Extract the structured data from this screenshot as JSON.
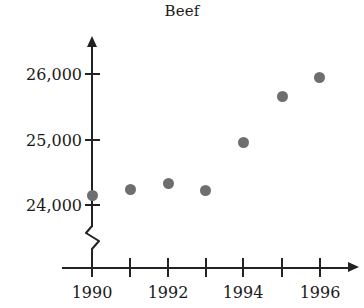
{
  "chart_data": {
    "type": "scatter",
    "title": "Beef",
    "xlabel": "",
    "ylabel": "",
    "x": [
      1990,
      1991,
      1992,
      1993,
      1994,
      1995,
      1996
    ],
    "values": [
      24150,
      24250,
      24340,
      24230,
      24960,
      25670,
      25950
    ],
    "series": [
      {
        "name": "Beef",
        "values": [
          24150,
          24250,
          24340,
          24230,
          24960,
          25670,
          25950
        ]
      }
    ],
    "xlim": [
      1989.5,
      1996.8
    ],
    "ylim": [
      24000,
      26200
    ],
    "y_ticks": [
      24000,
      25000,
      26000
    ],
    "y_tick_labels": [
      "24,000",
      "25,000",
      "26,000"
    ],
    "x_ticks": [
      1990,
      1991,
      1992,
      1993,
      1994,
      1995,
      1996
    ],
    "x_tick_labels": [
      "1990",
      "",
      "1992",
      "",
      "1994",
      "",
      "1996"
    ],
    "grid": false,
    "legend": "none",
    "axis_break": true,
    "marker_color": "#6e6e6e",
    "axis_color": "#222222",
    "text_color": "#1a1a1a",
    "background": "#ffffff"
  },
  "axis": {
    "y_labels": [
      {
        "text": "26,000",
        "top": 65
      },
      {
        "text": "25,000",
        "top": 131
      },
      {
        "text": "24,000",
        "top": 196
      }
    ],
    "y_tick_tops": [
      73,
      139,
      204
    ],
    "x_labels": [
      {
        "text": "1990",
        "left": 62
      },
      {
        "text": "1992",
        "left": 138
      },
      {
        "text": "1994",
        "left": 213
      },
      {
        "text": "1996",
        "left": 290
      }
    ],
    "x_tick_lefts": [
      91,
      129,
      167,
      205,
      242,
      281,
      319
    ]
  },
  "points": [
    {
      "name": "point-1990",
      "left": 87,
      "top": 190,
      "year": "1990",
      "value": "24,150"
    },
    {
      "name": "point-1991",
      "left": 125,
      "top": 184,
      "year": "1991",
      "value": "24,250"
    },
    {
      "name": "point-1992",
      "left": 163,
      "top": 178,
      "year": "1992",
      "value": "24,340"
    },
    {
      "name": "point-1993",
      "left": 200,
      "top": 185,
      "year": "1993",
      "value": "24,230"
    },
    {
      "name": "point-1994",
      "left": 238,
      "top": 137,
      "year": "1994",
      "value": "24,960"
    },
    {
      "name": "point-1995",
      "left": 277,
      "top": 91,
      "year": "1995",
      "value": "25,670"
    },
    {
      "name": "point-1996",
      "left": 314,
      "top": 72,
      "year": "1996",
      "value": "25,950"
    }
  ]
}
